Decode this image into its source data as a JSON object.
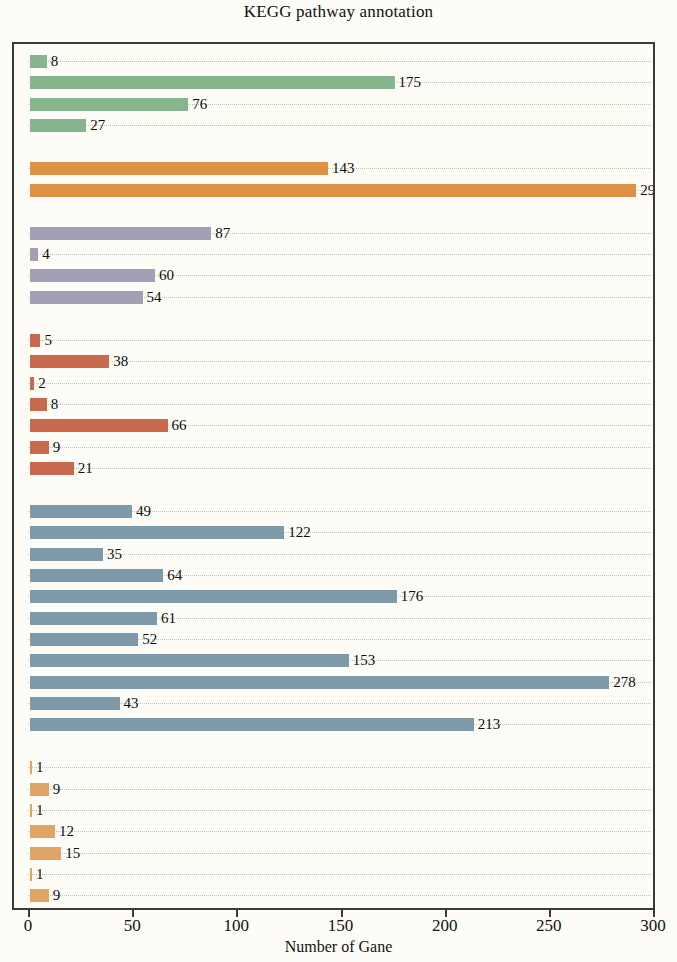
{
  "chart_data": {
    "type": "bar",
    "orientation": "horizontal",
    "title": "KEGG pathway annotation",
    "xlabel": "Number of Gane",
    "ylabel": "",
    "xlim": [
      0,
      300
    ],
    "xticks": [
      0,
      50,
      100,
      150,
      200,
      250,
      300
    ],
    "xticklabels": [
      "0",
      "50",
      "100",
      "150",
      "200",
      "250",
      "300"
    ],
    "grid": "dotted horizontal rows",
    "legend": "none",
    "categories_hidden": true,
    "groups": [
      {
        "name": "group-green",
        "color": "#87b58e",
        "values": [
          8,
          175,
          76,
          27
        ],
        "labels": [
          "8",
          "175",
          "76",
          "27"
        ]
      },
      {
        "name": "group-orange-top",
        "color": "#dd9144",
        "values": [
          143,
          291
        ],
        "labels": [
          "143",
          "291"
        ]
      },
      {
        "name": "group-purple",
        "color": "#a3a0b5",
        "values": [
          87,
          4,
          60,
          54
        ],
        "labels": [
          "87",
          "4",
          "60",
          "54"
        ]
      },
      {
        "name": "group-terracotta",
        "color": "#c96a4f",
        "values": [
          5,
          38,
          2,
          8,
          66,
          9,
          21
        ],
        "labels": [
          "5",
          "38",
          "2",
          "8",
          "66",
          "9",
          "21"
        ]
      },
      {
        "name": "group-blue",
        "color": "#7e99a8",
        "values": [
          49,
          122,
          35,
          64,
          176,
          61,
          52,
          153,
          278,
          43,
          213
        ],
        "labels": [
          "49",
          "122",
          "35",
          "64",
          "176",
          "61",
          "52",
          "153",
          "278",
          "43",
          "213"
        ]
      },
      {
        "name": "group-orange-bottom",
        "color": "#e0a565",
        "values": [
          1,
          9,
          1,
          12,
          15,
          1,
          9
        ],
        "labels": [
          "1",
          "9",
          "1",
          "12",
          "15",
          "1",
          "9"
        ]
      }
    ],
    "all_values": [
      8,
      175,
      76,
      27,
      143,
      291,
      87,
      4,
      60,
      54,
      5,
      38,
      2,
      8,
      66,
      9,
      21,
      49,
      122,
      35,
      64,
      176,
      61,
      52,
      153,
      278,
      43,
      213,
      1,
      9,
      1,
      12,
      15,
      1,
      9
    ],
    "colors": {
      "green": "#87b58e",
      "orange": "#dd9144",
      "purple": "#a3a0b5",
      "terracotta": "#c96a4f",
      "blue": "#7e99a8",
      "orange_light": "#e0a565",
      "frame": "#3a3a3a",
      "background": "#fdfcf7",
      "gridline": "#c9c2ad",
      "text": "#111111"
    }
  }
}
